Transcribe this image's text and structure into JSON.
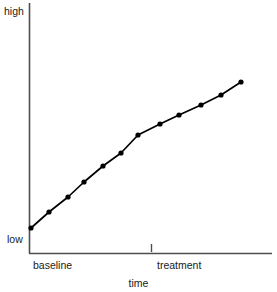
{
  "chart_data": {
    "type": "line",
    "title": "",
    "subtitle": "",
    "xlabel": "time",
    "ylabel": "",
    "grid": false,
    "legend": false,
    "legend_position": "none",
    "x_axis": {
      "label": "time",
      "tick_labels": [
        "baseline",
        "treatment"
      ],
      "tick_marks": [
        151
      ],
      "range_px": [
        29,
        272
      ],
      "note": "Two phase labels beneath the axis; a single small tick mark sits just above the axis at the start of the treatment phase."
    },
    "y_axis": {
      "label": "",
      "tick_labels": [
        "low",
        "high"
      ],
      "ylim": [
        "low",
        "high"
      ],
      "range_px": [
        253,
        3
      ],
      "note": "Ordinal/qualitative scale labelled only 'low' at the bottom and 'high' at the top."
    },
    "series": [
      {
        "name": "outcome",
        "marker": "filled-circle",
        "color": "#000000",
        "points": [
          {
            "x": 0,
            "phase": "baseline",
            "x_px": 31,
            "y_px": 228,
            "y_value": 0.11
          },
          {
            "x": 1,
            "phase": "baseline",
            "x_px": 49,
            "y_px": 212,
            "y_value": 0.18
          },
          {
            "x": 2,
            "phase": "baseline",
            "x_px": 68,
            "y_px": 197,
            "y_value": 0.24
          },
          {
            "x": 3,
            "phase": "baseline",
            "x_px": 84,
            "y_px": 182,
            "y_value": 0.3
          },
          {
            "x": 4,
            "phase": "baseline",
            "x_px": 103,
            "y_px": 166,
            "y_value": 0.37
          },
          {
            "x": 5,
            "phase": "baseline",
            "x_px": 121,
            "y_px": 153,
            "y_value": 0.42
          },
          {
            "x": 6,
            "phase": "baseline",
            "x_px": 138,
            "y_px": 135,
            "y_value": 0.5
          },
          {
            "x": 7,
            "phase": "treatment",
            "x_px": 160,
            "y_px": 124,
            "y_value": 0.54
          },
          {
            "x": 8,
            "phase": "treatment",
            "x_px": 179,
            "y_px": 115,
            "y_value": 0.58
          },
          {
            "x": 9,
            "phase": "treatment",
            "x_px": 201,
            "y_px": 105,
            "y_value": 0.62
          },
          {
            "x": 10,
            "phase": "treatment",
            "x_px": 221,
            "y_px": 95,
            "y_value": 0.66
          },
          {
            "x": 11,
            "phase": "treatment",
            "x_px": 241,
            "y_px": 82,
            "y_value": 0.71
          }
        ]
      }
    ],
    "annotations": [
      "Steadily rising trend across the baseline phase that continues rising, with a slightly shallower slope, through the treatment phase."
    ]
  },
  "labels": {
    "high": "high",
    "low": "low",
    "baseline": "baseline",
    "treatment": "treatment",
    "time": "time"
  },
  "colors": {
    "line": "#000000",
    "marker": "#000000",
    "axis": "#4d4d4d",
    "text": "#1a1a1a",
    "background": "#ffffff"
  }
}
